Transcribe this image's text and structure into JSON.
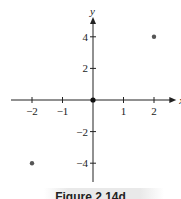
{
  "caption": "Figure 2.14d",
  "chart_data": {
    "type": "scatter",
    "title": "",
    "xlabel": "x",
    "ylabel": "y",
    "xlim": [
      -2.6,
      2.6
    ],
    "ylim": [
      -5,
      5
    ],
    "x_ticks": [
      -2,
      -1,
      1,
      2
    ],
    "x_tick_labels": [
      "−2",
      "−1",
      "1",
      "2"
    ],
    "y_ticks": [
      -4,
      -2,
      2,
      4
    ],
    "y_tick_labels": [
      "−4",
      "−2",
      "2",
      "4"
    ],
    "grid": false,
    "series": [
      {
        "name": "points",
        "points": [
          [
            -2,
            -4
          ],
          [
            0,
            0
          ],
          [
            2,
            4
          ]
        ]
      }
    ],
    "colors": {
      "axis": "#222222",
      "point": "#555555",
      "origin_point": "#111111"
    }
  }
}
